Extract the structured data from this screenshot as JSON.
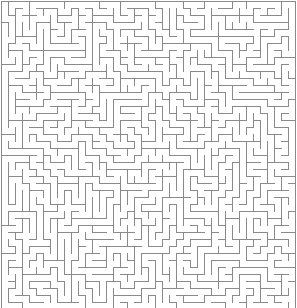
{
  "page": {
    "kind": "maze-puzzle",
    "width": 297,
    "height": 308,
    "background_color": "#ffffff"
  },
  "maze": {
    "type": "perfect-maze",
    "algorithm": "randomized-depth-first-search",
    "seed": 20240517,
    "columns": 42,
    "rows": 44,
    "cell_size": 7,
    "offset_x": 1,
    "offset_y": 1,
    "wall_color": "#8a8a8a",
    "wall_thickness": 1,
    "background_color": "#ffffff",
    "border": {
      "top": true,
      "right": true,
      "bottom": true,
      "left": true
    },
    "entrance": null,
    "exit": null,
    "solution_shown": false,
    "labels_shown": false
  }
}
